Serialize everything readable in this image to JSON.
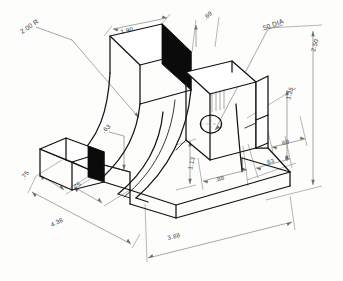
{
  "drawing": {
    "title": "Isometric pictorial — curved saddle bracket",
    "type": "isometric-engineering-drawing",
    "medium": "hand-drawn pencil sketch on white paper",
    "background_color": "#fdfdfb",
    "line_color": "#111111",
    "dimension_line_color": "#6d6d6d",
    "shaded_face_color": "#0b0b0b",
    "units": "inches (decimal)"
  },
  "dimensions": [
    {
      "id": "d-2-00R",
      "label": "2.00 R",
      "kind": "radius",
      "placement": "upper-left, leader to inner arc"
    },
    {
      "id": "d-1-90",
      "label": "1.90",
      "kind": "linear",
      "placement": "top face width, upper-left block"
    },
    {
      "id": "d-0-69t",
      "label": ".69",
      "kind": "linear",
      "placement": "top, right of 1.90"
    },
    {
      "id": "d-50dia",
      "label": ".50 DIA",
      "kind": "diameter",
      "placement": "leader to circular hole on right upright"
    },
    {
      "id": "d-2-50",
      "label": "2.50",
      "kind": "linear",
      "placement": "far right, overall height"
    },
    {
      "id": "d-1-25",
      "label": "1.25",
      "kind": "linear",
      "placement": "right, hole height from base"
    },
    {
      "id": "d-0-63a",
      "label": ".63",
      "kind": "linear",
      "placement": "mid-left, arc thickness leader"
    },
    {
      "id": "d-1-13",
      "label": "1.13",
      "kind": "linear",
      "placement": "center-right vertical"
    },
    {
      "id": "d-0-88",
      "label": ".88",
      "kind": "linear",
      "placement": "center-right horizontal, lower"
    },
    {
      "id": "d-0-63b",
      "label": ".63",
      "kind": "linear",
      "placement": "lower right"
    },
    {
      "id": "d-0-69b",
      "label": ".69",
      "kind": "linear",
      "placement": "lower right, outer"
    },
    {
      "id": "d-0-75a",
      "label": ".75",
      "kind": "linear",
      "placement": "lower left, front depth"
    },
    {
      "id": "d-0-75b",
      "label": ".75",
      "kind": "linear",
      "placement": "lower left-center, front depth"
    },
    {
      "id": "d-4-38",
      "label": "4.38",
      "kind": "linear",
      "placement": "bottom left, overall depth"
    },
    {
      "id": "d-3-88",
      "label": "3.88",
      "kind": "linear",
      "placement": "bottom center, overall length"
    }
  ],
  "features": {
    "hole": {
      "name": "through-hole",
      "label": ".50 DIA",
      "has_center_mark": true
    },
    "shaded_faces": 2,
    "arc_count": 2,
    "arc_description": "concentric quarter-round inner and outer arcs forming the curved saddle"
  }
}
